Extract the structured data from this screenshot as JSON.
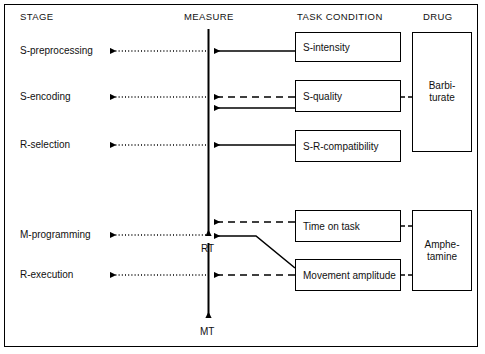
{
  "diagram": {
    "title_headers": [
      {
        "label": "STAGE",
        "x": 20,
        "y": 11
      },
      {
        "label": "MEASURE",
        "x": 184,
        "y": 11
      },
      {
        "label": "TASK CONDITION",
        "x": 297,
        "y": 11
      },
      {
        "label": "DRUG",
        "x": 423,
        "y": 11
      }
    ],
    "stages": [
      {
        "label": "S-preprocessing",
        "y": 45
      },
      {
        "label": "S-encoding",
        "y": 91
      },
      {
        "label": "R-selection",
        "y": 139
      },
      {
        "label": "M-programming",
        "y": 229
      },
      {
        "label": "R-execution",
        "y": 269
      }
    ],
    "measure_labels": [
      {
        "label": "RT",
        "x": 201,
        "y": 243
      },
      {
        "label": "MT",
        "x": 200,
        "y": 326
      }
    ],
    "task_conditions": [
      {
        "label": "S-intensity",
        "x": 295,
        "y": 32,
        "w": 106,
        "h": 30
      },
      {
        "label": "S-quality",
        "x": 295,
        "y": 80,
        "w": 106,
        "h": 32
      },
      {
        "label": "S-R-compatibility",
        "x": 295,
        "y": 130,
        "w": 106,
        "h": 32
      },
      {
        "label": "Time on task",
        "x": 295,
        "y": 210,
        "w": 106,
        "h": 32
      },
      {
        "label": "Movement amplitude",
        "x": 295,
        "y": 259,
        "w": 106,
        "h": 32
      }
    ],
    "drugs": [
      {
        "label": "Barbi-\nturate",
        "x": 412,
        "y": 32,
        "w": 60,
        "h": 120
      },
      {
        "label": "Amphe-\ntamine",
        "x": 412,
        "y": 210,
        "w": 60,
        "h": 81
      }
    ],
    "colors": {
      "line": "#000000",
      "background": "#ffffff",
      "text": "#111111"
    }
  }
}
